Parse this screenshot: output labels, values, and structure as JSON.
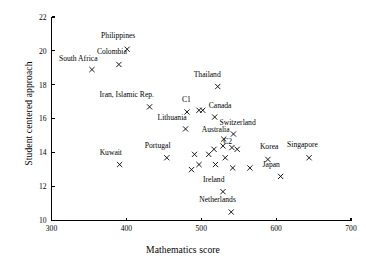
{
  "chart_data": {
    "type": "scatter",
    "title": "",
    "xlabel": "Mathematics score",
    "ylabel": "Student centered approach",
    "xlim": [
      300,
      700
    ],
    "ylim": [
      10,
      22
    ],
    "xticks": [
      300,
      400,
      500,
      600,
      700
    ],
    "yticks": [
      10,
      12,
      14,
      16,
      18,
      20,
      22
    ],
    "grid": false,
    "legend": "none",
    "marker": "x",
    "points": [
      {
        "label": "Philippines",
        "x": 401,
        "y": 20.1,
        "label_dx": -26,
        "label_dy": -10
      },
      {
        "label": "Colombia",
        "x": 390,
        "y": 19.2,
        "label_dx": -22,
        "label_dy": -9
      },
      {
        "label": "South Africa",
        "x": 354,
        "y": 18.9,
        "label_dx": -33,
        "label_dy": -8
      },
      {
        "label": "Thailand",
        "x": 522,
        "y": 17.9,
        "label_dx": -24,
        "label_dy": -9
      },
      {
        "label": "Iran, Islamic Rep.",
        "x": 431,
        "y": 16.7,
        "label_dx": -50,
        "label_dy": -9
      },
      {
        "label": "C1",
        "x": 481,
        "y": 16.4,
        "label_dx": -5,
        "label_dy": -9
      },
      {
        "label": "",
        "x": 502,
        "y": 16.5,
        "label_dx": 0,
        "label_dy": 0
      },
      {
        "label": "",
        "x": 497,
        "y": 16.5,
        "label_dx": 0,
        "label_dy": 0
      },
      {
        "label": "Canada",
        "x": 518,
        "y": 16.1,
        "label_dx": -6,
        "label_dy": -8
      },
      {
        "label": "Lithuania",
        "x": 479,
        "y": 15.4,
        "label_dx": -28,
        "label_dy": -8
      },
      {
        "label": "Switzerland",
        "x": 543,
        "y": 15.1,
        "label_dx": -14,
        "label_dy": -8
      },
      {
        "label": "Australia",
        "x": 530,
        "y": 14.8,
        "label_dx": -22,
        "label_dy": -6
      },
      {
        "label": "C2",
        "x": 532,
        "y": 13.7,
        "label_dx": -2,
        "label_dy": -13
      },
      {
        "label": "",
        "x": 529,
        "y": 14.4,
        "label_dx": 0,
        "label_dy": 0
      },
      {
        "label": "",
        "x": 517,
        "y": 14.2,
        "label_dx": 0,
        "label_dy": 0
      },
      {
        "label": "",
        "x": 541,
        "y": 14.3,
        "label_dx": 0,
        "label_dy": 0
      },
      {
        "label": "",
        "x": 548,
        "y": 14.2,
        "label_dx": 0,
        "label_dy": 0
      },
      {
        "label": "Portugal",
        "x": 454,
        "y": 13.7,
        "label_dx": -22,
        "label_dy": -9
      },
      {
        "label": "Kuwait",
        "x": 391,
        "y": 13.3,
        "label_dx": -20,
        "label_dy": -9
      },
      {
        "label": "",
        "x": 491,
        "y": 13.9,
        "label_dx": 0,
        "label_dy": 0
      },
      {
        "label": "",
        "x": 510,
        "y": 13.9,
        "label_dx": 0,
        "label_dy": 0
      },
      {
        "label": "",
        "x": 487,
        "y": 13.0,
        "label_dx": 0,
        "label_dy": 0
      },
      {
        "label": "",
        "x": 497,
        "y": 13.3,
        "label_dx": 0,
        "label_dy": 0
      },
      {
        "label": "",
        "x": 519,
        "y": 13.3,
        "label_dx": 0,
        "label_dy": 0
      },
      {
        "label": "",
        "x": 542,
        "y": 13.1,
        "label_dx": 0,
        "label_dy": 0
      },
      {
        "label": "",
        "x": 565,
        "y": 13.1,
        "label_dx": 0,
        "label_dy": 0
      },
      {
        "label": "Korea",
        "x": 589,
        "y": 13.6,
        "label_dx": -8,
        "label_dy": -9
      },
      {
        "label": "Singapore",
        "x": 644,
        "y": 13.7,
        "label_dx": -22,
        "label_dy": -10
      },
      {
        "label": "Japan",
        "x": 606,
        "y": 12.6,
        "label_dx": -18,
        "label_dy": -8
      },
      {
        "label": "Ireland",
        "x": 529,
        "y": 11.7,
        "label_dx": -20,
        "label_dy": -9
      },
      {
        "label": "Netherlands",
        "x": 540,
        "y": 10.5,
        "label_dx": -32,
        "label_dy": -9
      }
    ]
  }
}
